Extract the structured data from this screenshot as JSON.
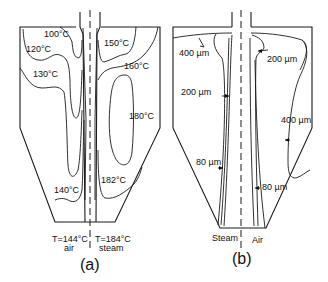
{
  "figure": {
    "panel_a": {
      "caption": "(a)",
      "contour_labels": {
        "c100": "100°C",
        "c120": "120°C",
        "c130": "130°C",
        "c140": "140°C",
        "c150": "150°C",
        "c160": "160°C",
        "c180": "180°C",
        "c182": "182°C"
      },
      "inlet_left": {
        "temp": "T=144°C",
        "medium": "air"
      },
      "inlet_right": {
        "temp": "T=184°C",
        "medium": "steam"
      }
    },
    "panel_b": {
      "caption": "(b)",
      "size_labels": {
        "top_left": "400 µm",
        "top_right": "200 µm",
        "mid_left": "200 µm",
        "mid_right": "400 µm",
        "low_left": "80 µm",
        "low_right": "80 µm"
      },
      "bottom_left": "Steam",
      "bottom_right": "Air"
    }
  }
}
